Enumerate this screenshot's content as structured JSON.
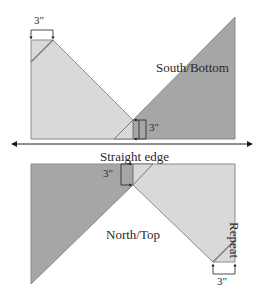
{
  "diagram": {
    "title_top": "South/Bottom",
    "title_bottom": "North/Top",
    "straight_edge_label": "Straight edge",
    "repeat_label": "Repeat",
    "measurements": {
      "top_left": "3\"",
      "center_top": "3\"",
      "center_bottom": "3\"",
      "bottom_right": "3\""
    },
    "colors": {
      "light_fabric": "#d9d9d9",
      "dark_fabric": "#a6a6a6",
      "outline": "#777777",
      "text": "#2a2a2a"
    }
  }
}
